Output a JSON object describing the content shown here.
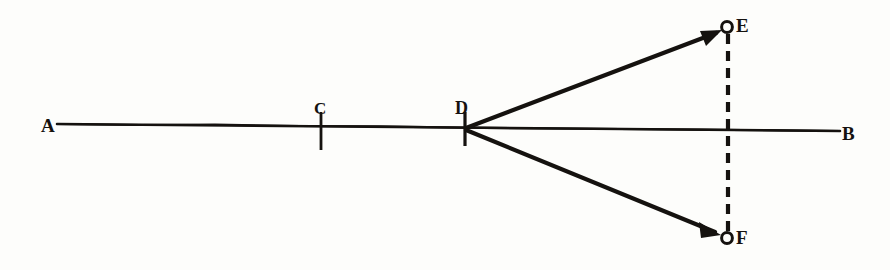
{
  "figure": {
    "background_color": "#fdfdfb",
    "ink_color": "#15120f",
    "labels": {
      "a": "A",
      "b": "B",
      "c": "C",
      "d": "D",
      "e": "E",
      "f": "F"
    },
    "geometry": {
      "baseline": {
        "name": "line-AB",
        "x1": 57,
        "y1": 124,
        "x2": 840,
        "y2": 131,
        "stroke_width": 2.6
      },
      "ticks": [
        {
          "name": "tick-C",
          "x": 321,
          "y1": 112,
          "y2": 150,
          "stroke_width": 2.8
        },
        {
          "name": "tick-D",
          "x": 465,
          "y1": 112,
          "y2": 146,
          "stroke_width": 3.2
        }
      ],
      "rays": [
        {
          "name": "ray-D-to-E",
          "x1": 466,
          "y1": 128,
          "x2": 722,
          "y2": 31,
          "stroke_width": 4.2,
          "arrowhead": true
        },
        {
          "name": "ray-D-to-F",
          "x1": 466,
          "y1": 130,
          "x2": 721,
          "y2": 234,
          "stroke_width": 4.2,
          "arrowhead": true
        }
      ],
      "dashed_segment": {
        "name": "dashed-line-EF",
        "x": 728,
        "y1": 33,
        "y2": 232,
        "stroke_width": 4.2,
        "dash_length": 10,
        "gap_length": 7
      },
      "points": [
        {
          "name": "point-E",
          "cx": 727,
          "cy": 27,
          "r": 5.4,
          "stroke_width": 3.0,
          "filled": false
        },
        {
          "name": "point-F",
          "cx": 727,
          "cy": 238,
          "r": 5.4,
          "stroke_width": 3.0,
          "filled": false
        }
      ]
    }
  }
}
